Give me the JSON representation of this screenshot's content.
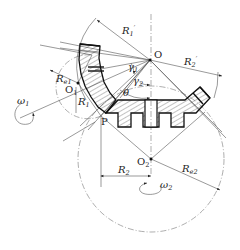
{
  "diagram": {
    "points": {
      "O": "O",
      "O1": "O",
      "O1_sub": "1",
      "O2": "O",
      "O2_sub": "2",
      "P": "P"
    },
    "dimensions": {
      "R1_prime": "R",
      "R1_prime_sub": "1",
      "R1_prime_sup": "′",
      "R2_prime": "R",
      "R2_prime_sub": "2",
      "R2_prime_sup": "′",
      "Re1": "R",
      "Re1_sub": "e1",
      "R1": "R",
      "R1_sub": "1",
      "R2": "R",
      "R2_sub": "2",
      "Re2": "R",
      "Re2_sub": "e2"
    },
    "angles": {
      "gamma1": "γ",
      "gamma1_sub": "1",
      "gamma2": "γ",
      "gamma2_sub": "2",
      "theta": "θ"
    },
    "rotations": {
      "omega1": "ω",
      "omega1_sub": "1",
      "omega2": "ω",
      "omega2_sub": "2"
    },
    "colors": {
      "line": "#111111",
      "thin_line": "#555555",
      "background": "#ffffff"
    }
  }
}
